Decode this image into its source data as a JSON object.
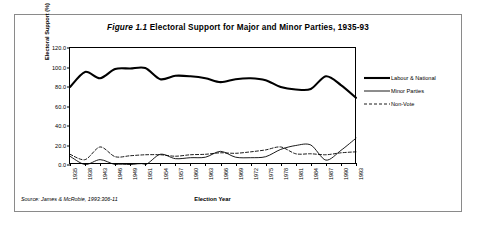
{
  "figure": {
    "title_prefix": "Figure 1.1",
    "title_text": "Electoral Support for Major and Minor Parties, 1935-93",
    "source_note": "Source: James & McRobie, 1993:306-11"
  },
  "legend": {
    "position": "right",
    "entries": [
      {
        "label": "Labour & National",
        "style": "thick-solid"
      },
      {
        "label": "Minor Parties",
        "style": "thin-solid"
      },
      {
        "label": "Non-Vote",
        "style": "dashed"
      }
    ]
  },
  "axes": {
    "y": {
      "label": "Electoral Support (%)",
      "ticks": [
        "0.0",
        "20.0",
        "40.0",
        "60.0",
        "80.0",
        "100.0",
        "120.0"
      ],
      "min": 0,
      "max": 120,
      "step": 20
    },
    "x": {
      "label": "Election Year",
      "ticks": [
        "1935",
        "1938",
        "1943",
        "1946",
        "1949",
        "1951",
        "1954",
        "1957",
        "1960",
        "1963",
        "1966",
        "1969",
        "1972",
        "1975",
        "1978",
        "1981",
        "1984",
        "1987",
        "1990",
        "1993"
      ]
    }
  },
  "chart_data": {
    "type": "line",
    "title": "Figure 1.1 Electoral Support for Major and Minor Parties, 1935-93",
    "xlabel": "Election Year",
    "ylabel": "Electoral Support (%)",
    "ylim": [
      0,
      120
    ],
    "yticks": [
      0,
      20,
      40,
      60,
      80,
      100,
      120
    ],
    "grid": false,
    "legend_position": "right",
    "categories": [
      "1935",
      "1938",
      "1943",
      "1946",
      "1949",
      "1951",
      "1954",
      "1957",
      "1960",
      "1963",
      "1966",
      "1969",
      "1972",
      "1975",
      "1978",
      "1981",
      "1984",
      "1987",
      "1990",
      "1993"
    ],
    "series": [
      {
        "name": "Labour & National",
        "style": "thick-solid",
        "values": [
          80.0,
          95.5,
          89.0,
          98.5,
          99.0,
          99.5,
          88.0,
          91.5,
          91.0,
          89.0,
          85.0,
          88.0,
          89.0,
          87.0,
          80.0,
          77.5,
          78.0,
          91.0,
          82.0,
          69.0
        ]
      },
      {
        "name": "Minor Parties",
        "style": "thin-solid",
        "values": [
          9.0,
          0.5,
          5.5,
          0.5,
          0.5,
          0.2,
          11.0,
          6.5,
          7.5,
          8.0,
          14.0,
          8.0,
          7.5,
          8.5,
          16.0,
          20.0,
          20.5,
          5.0,
          15.0,
          27.5
        ]
      },
      {
        "name": "Non-Vote",
        "style": "dashed",
        "values": [
          11.0,
          5.5,
          18.5,
          8.5,
          9.5,
          10.5,
          10.5,
          9.0,
          10.5,
          11.0,
          12.5,
          12.0,
          13.5,
          15.5,
          18.5,
          11.5,
          11.5,
          10.5,
          12.5,
          13.5
        ]
      }
    ]
  }
}
